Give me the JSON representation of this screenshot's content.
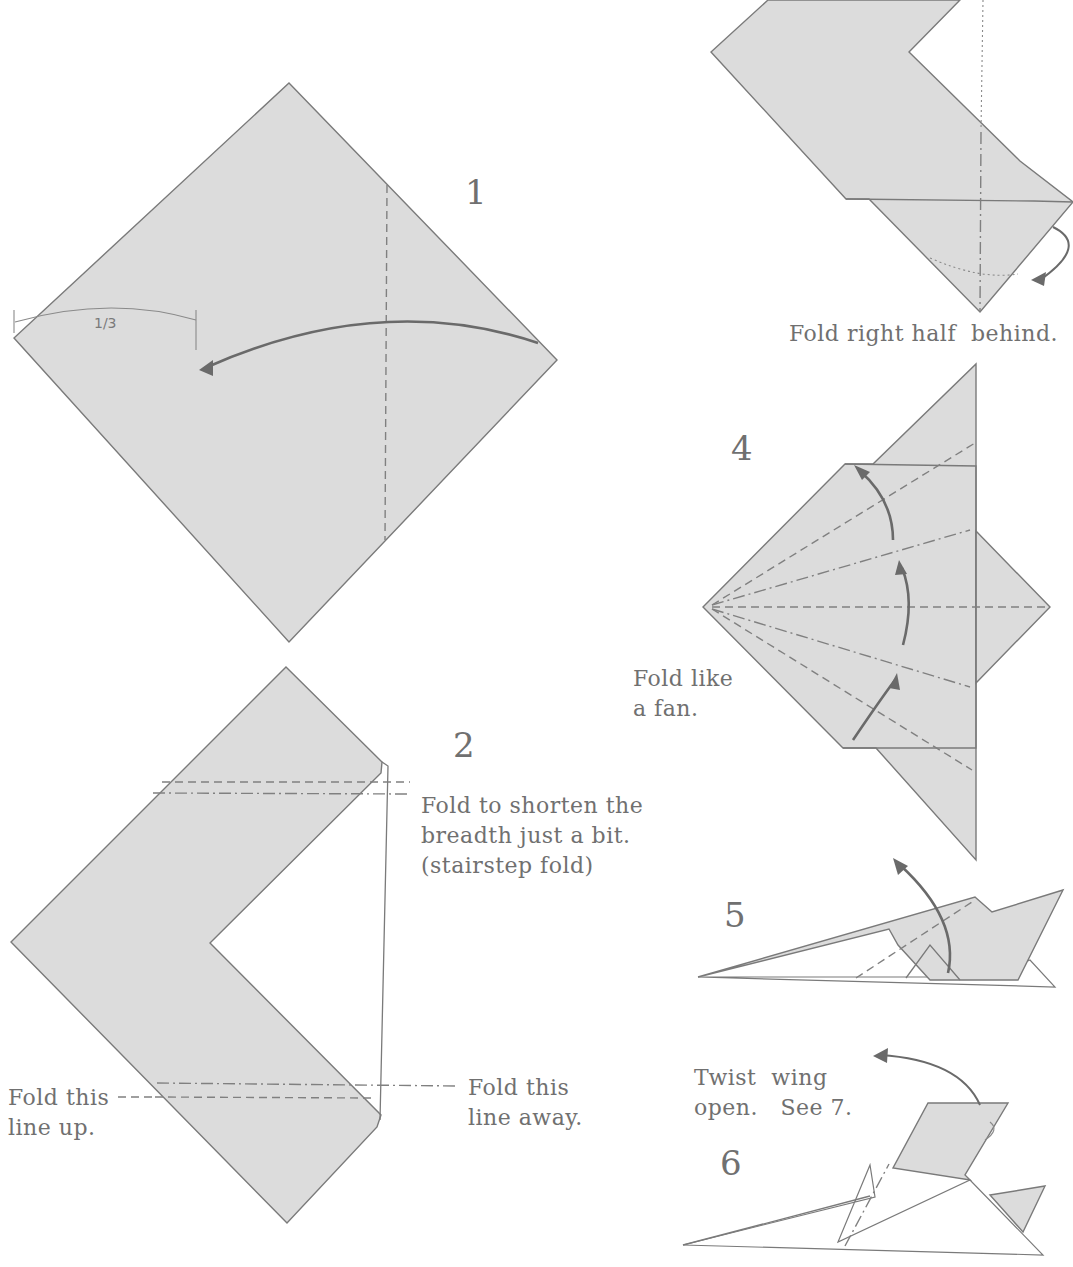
{
  "steps": [
    {
      "number": "1",
      "measure_label": "1/3"
    },
    {
      "number": "2",
      "note_top": [
        "Fold to shorten the",
        "breadth just a bit.",
        "(stairstep fold)"
      ],
      "note_left": [
        "Fold this",
        "line up."
      ],
      "note_right": [
        "Fold this",
        "line away."
      ]
    },
    {
      "number": "3",
      "caption": "Fold right half  behind."
    },
    {
      "number": "4",
      "note": [
        "Fold like",
        "a fan."
      ]
    },
    {
      "number": "5"
    },
    {
      "number": "6",
      "note": [
        "Twist  wing",
        "open.   See 7."
      ]
    }
  ],
  "colors": {
    "paper": "#dcdcdc",
    "line": "#7a7a7a",
    "text": "#707070",
    "background": "#ffffff"
  }
}
